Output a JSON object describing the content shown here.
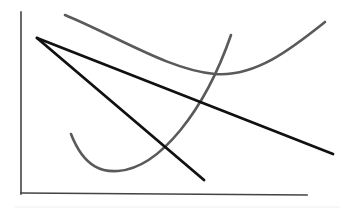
{
  "diagram": {
    "type": "sketch-line-diagram",
    "background": "#ffffff",
    "axes": {
      "color": "#444444",
      "y_axis": {
        "x": 21,
        "y_top": 12,
        "y_bottom": 194
      },
      "x_axis": {
        "x_left": 21,
        "y_left": 193,
        "x_right": 307,
        "y_right": 195
      },
      "labels": []
    },
    "bottom_rule": {
      "color": "#eeeeee",
      "x1": 15,
      "y1": 207,
      "x2": 340,
      "y2": 207
    },
    "lines": [
      {
        "name": "black-line-long",
        "color": "#111111",
        "width": 2.8,
        "x1": 37,
        "y1": 38,
        "x2": 333,
        "y2": 154
      },
      {
        "name": "black-line-steep",
        "color": "#111111",
        "width": 2.8,
        "x1": 37,
        "y1": 38,
        "x2": 204,
        "y2": 180
      }
    ],
    "curves": [
      {
        "name": "gray-u-curve",
        "color": "#5a5a5a",
        "width": 2.6,
        "d": "M 65 15 C 120 38, 170 70, 215 74 C 255 77, 290 50, 325 22"
      },
      {
        "name": "gray-j-curve",
        "color": "#5a5a5a",
        "width": 2.6,
        "d": "M 71 134 C 85 170, 105 172, 118 171 C 160 168, 205 110, 231 35"
      }
    ]
  }
}
